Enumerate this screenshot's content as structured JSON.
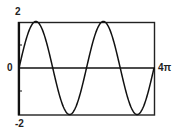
{
  "chart_data": {
    "type": "line",
    "title": "",
    "function": "y = 2 sin(x)",
    "xlabel": "",
    "ylabel": "",
    "xlim": [
      0,
      12.566370614359172
    ],
    "ylim": [
      -2,
      2
    ],
    "grid": false,
    "legend": null,
    "tick_labels": {
      "y_top": "2",
      "y_zero": "0",
      "y_bottom": "-2",
      "x_right": "4π"
    },
    "y_ticks": [
      2,
      1,
      0,
      -1,
      -2
    ],
    "series": [
      {
        "name": "2 sin(x)",
        "amplitude": 2,
        "periods": 2,
        "key_points": [
          {
            "x": 0,
            "y": 0
          },
          {
            "x": 1.5708,
            "y": 2
          },
          {
            "x": 3.1416,
            "y": 0
          },
          {
            "x": 4.7124,
            "y": -2
          },
          {
            "x": 6.2832,
            "y": 0
          },
          {
            "x": 7.854,
            "y": 2
          },
          {
            "x": 9.4248,
            "y": 0
          },
          {
            "x": 10.9956,
            "y": -2
          },
          {
            "x": 12.5664,
            "y": 0
          }
        ]
      }
    ]
  },
  "labels": {
    "y_max": "2",
    "y_zero": "0",
    "y_min": "-2",
    "x_max": "4π"
  },
  "colors": {
    "line": "#111111",
    "frame": "#222222"
  }
}
